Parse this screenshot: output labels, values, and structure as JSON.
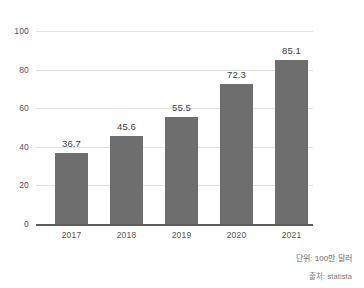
{
  "chart_data": {
    "type": "bar",
    "title": "",
    "subtitle": "",
    "xlabel": "",
    "ylabel": "",
    "categories": [
      "2017",
      "2018",
      "2019",
      "2020",
      "2021"
    ],
    "values": [
      36.7,
      45.6,
      55.5,
      72.3,
      85.1
    ],
    "value_labels": [
      "36.7",
      "45.6",
      "55.5",
      "72.3",
      "85.1"
    ],
    "ylim": [
      0,
      100
    ],
    "yticks": [
      0,
      20,
      40,
      60,
      80,
      100
    ],
    "ytick_labels": [
      "0",
      "20",
      "40",
      "60",
      "80",
      "100"
    ],
    "grid": true,
    "legend": "none",
    "bar_color": "#6e6e6e",
    "gridline_color": "#e3e3e3",
    "axis_color": "#5d5d5d",
    "background_color": "#ffffff"
  },
  "footer": {
    "unit_note": "단위: 100만 달러",
    "source_note": "출처: statista"
  }
}
